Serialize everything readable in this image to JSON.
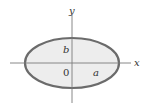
{
  "diagram": {
    "type": "ellipse-on-axes",
    "axes": {
      "x_label": "x",
      "y_label": "y",
      "origin_label": "0",
      "axis_color": "#7a7a7a"
    },
    "ellipse": {
      "semi_major_label": "a",
      "semi_minor_label": "b",
      "fill_color": "#ededed",
      "stroke_color": "#6b6b6b"
    }
  }
}
